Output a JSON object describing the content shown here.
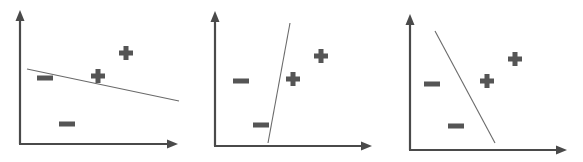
{
  "figure": {
    "width": 583,
    "height": 162,
    "colors": {
      "axis": "#4a4a4a",
      "boundary": "#6a6a6a",
      "marker": "#555555",
      "background": "#ffffff"
    },
    "panels": [
      {
        "id": "panel-1",
        "description": "Nearly horizontal decision boundary sloping down",
        "axes": {
          "origin": [
            20,
            144
          ],
          "y_top": 10,
          "x_right": 178
        },
        "boundary": {
          "x1": 27,
          "y1": 69,
          "x2": 179,
          "y2": 101
        },
        "points": [
          {
            "label": "−",
            "class": "negative",
            "x": 45,
            "y": 78
          },
          {
            "label": "−",
            "class": "negative",
            "x": 67,
            "y": 124
          },
          {
            "label": "+",
            "class": "positive",
            "x": 98,
            "y": 76
          },
          {
            "label": "+",
            "class": "positive",
            "x": 126,
            "y": 53
          }
        ]
      },
      {
        "id": "panel-2",
        "description": "Nearly vertical decision boundary",
        "axes": {
          "origin": [
            215,
            146
          ],
          "y_top": 11,
          "x_right": 372
        },
        "boundary": {
          "x1": 290,
          "y1": 23,
          "x2": 268,
          "y2": 143
        },
        "points": [
          {
            "label": "−",
            "class": "negative",
            "x": 241,
            "y": 81
          },
          {
            "label": "−",
            "class": "negative",
            "x": 261,
            "y": 125
          },
          {
            "label": "+",
            "class": "positive",
            "x": 293,
            "y": 79
          },
          {
            "label": "+",
            "class": "positive",
            "x": 321,
            "y": 56
          }
        ]
      },
      {
        "id": "panel-3",
        "description": "Steep decision boundary sloping down-right",
        "axes": {
          "origin": [
            410,
            150
          ],
          "y_top": 14,
          "x_right": 567
        },
        "boundary": {
          "x1": 435,
          "y1": 31,
          "x2": 495,
          "y2": 143
        },
        "points": [
          {
            "label": "−",
            "class": "negative",
            "x": 432,
            "y": 84
          },
          {
            "label": "−",
            "class": "negative",
            "x": 456,
            "y": 126
          },
          {
            "label": "+",
            "class": "positive",
            "x": 487,
            "y": 81
          },
          {
            "label": "+",
            "class": "positive",
            "x": 515,
            "y": 59
          }
        ]
      }
    ]
  }
}
